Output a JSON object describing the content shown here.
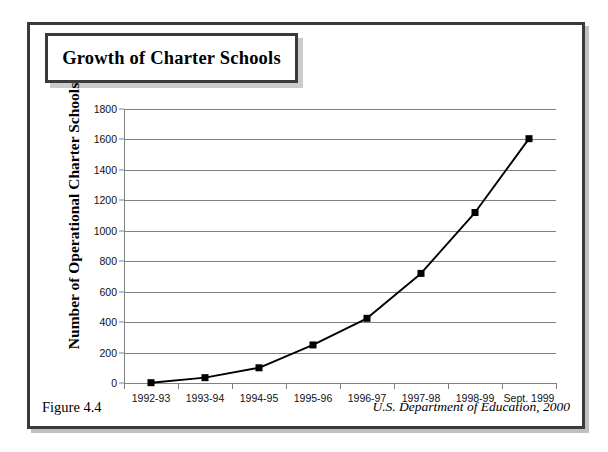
{
  "figure": {
    "title": "Growth of Charter Schools",
    "caption": "Figure 4.4",
    "source": "U.S. Department of Education, 2000"
  },
  "chart_data": {
    "type": "line",
    "title": "Growth of Charter Schools",
    "xlabel": "",
    "ylabel": "Number of Operational Charter Schools",
    "categories": [
      "1992-93",
      "1993-94",
      "1994-95",
      "1995-96",
      "1996-97",
      "1997-98",
      "1998-99",
      "Sept. 1999"
    ],
    "values": [
      2,
      35,
      100,
      250,
      425,
      720,
      1120,
      1605
    ],
    "ylim": [
      0,
      1800
    ],
    "ytick_values": [
      0,
      200,
      400,
      600,
      800,
      1000,
      1200,
      1400,
      1600,
      1800
    ],
    "ytick_labels": [
      "0",
      "200",
      "400",
      "600",
      "800",
      "1000",
      "1200",
      "1400",
      "1600",
      "1800"
    ],
    "grid": "horizontal",
    "legend": "none",
    "marker": "square",
    "line_color": "#000000",
    "marker_color": "#000000",
    "grid_color": "#808080"
  }
}
